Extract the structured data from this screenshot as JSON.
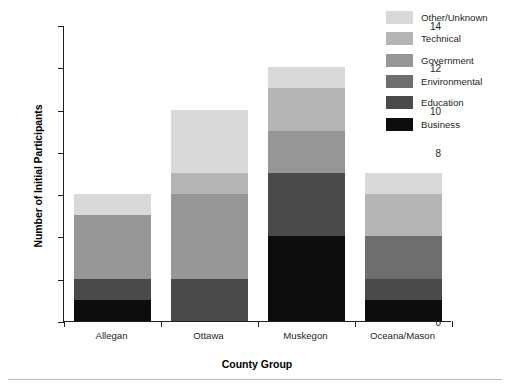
{
  "chart_data": {
    "type": "bar",
    "subtype": "stacked-vertical",
    "title": "",
    "xlabel": "County Group",
    "ylabel": "Number of Initial Participants",
    "categories": [
      "Allegan",
      "Ottawa",
      "Muskegon",
      "Oceana/Mason"
    ],
    "ylim": [
      0,
      14
    ],
    "yticks": [
      0,
      2,
      4,
      6,
      8,
      10,
      12,
      14
    ],
    "ytick_labels": [
      "0",
      "2",
      "4",
      "6",
      "8",
      "10",
      "12",
      "14"
    ],
    "grid": false,
    "legend_position": "top-right",
    "legend_order_top_to_bottom": [
      "Other/Unknown",
      "Technical",
      "Government",
      "Environmental",
      "Education",
      "Business"
    ],
    "stack_order_bottom_to_top": [
      "Business",
      "Education",
      "Environmental",
      "Government",
      "Technical",
      "Other/Unknown"
    ],
    "series": [
      {
        "name": "Business",
        "color": "#0d0d0d",
        "values": [
          1,
          0,
          4,
          1
        ]
      },
      {
        "name": "Education",
        "color": "#4a4a4a",
        "values": [
          1,
          2,
          3,
          1
        ]
      },
      {
        "name": "Environmental",
        "color": "#6e6e6e",
        "values": [
          0,
          0,
          0,
          2
        ]
      },
      {
        "name": "Government",
        "color": "#969696",
        "values": [
          3,
          4,
          2,
          0
        ]
      },
      {
        "name": "Technical",
        "color": "#b5b5b5",
        "values": [
          0,
          1,
          2,
          2
        ]
      },
      {
        "name": "Other/Unknown",
        "color": "#d9d9d9",
        "values": [
          1,
          3,
          1,
          1
        ]
      }
    ],
    "totals": [
      6,
      10,
      12,
      7
    ]
  },
  "legend": {
    "items": [
      {
        "label": "Other/Unknown",
        "color": "#d9d9d9"
      },
      {
        "label": "Technical",
        "color": "#b5b5b5"
      },
      {
        "label": "Government",
        "color": "#969696"
      },
      {
        "label": "Environmental",
        "color": "#6e6e6e"
      },
      {
        "label": "Education",
        "color": "#4a4a4a"
      },
      {
        "label": "Business",
        "color": "#0d0d0d"
      }
    ]
  },
  "axes": {
    "y_title": "Number of Initial Participants",
    "x_title": "County Group"
  }
}
